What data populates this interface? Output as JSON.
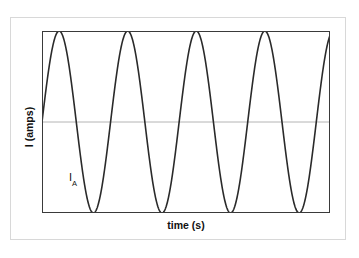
{
  "figure": {
    "name": "alternating-current-waveform",
    "background_color": "#ffffff",
    "outer_border_color": "#d8d8d8",
    "plot_frame_color": "#3a3a3a",
    "midline_color": "#b4b4b4",
    "curve_color": "#2a2a2a"
  },
  "labels": {
    "y_axis": "I (amps)",
    "x_axis": "time (s)",
    "curve_symbol": "I",
    "curve_subscript": "A"
  },
  "chart_data": {
    "type": "line",
    "title": "",
    "xlabel": "time (s)",
    "ylabel": "I (amps)",
    "grid": false,
    "legend": "none",
    "midline_value": 0,
    "xlim": [
      0,
      4.2
    ],
    "ylim": [
      -1,
      1
    ],
    "annotations": [
      {
        "text": "I_A",
        "x": 0.42,
        "y": -0.63
      }
    ],
    "series": [
      {
        "name": "I_A",
        "waveform": "sine",
        "amplitude": 1,
        "cycles": 4.2,
        "period": 1,
        "phase_deg": 0,
        "x": [
          0,
          0.05,
          0.1,
          0.15,
          0.2,
          0.25,
          0.3,
          0.35,
          0.4,
          0.45,
          0.5,
          0.55,
          0.6,
          0.65,
          0.7,
          0.75,
          0.8,
          0.85,
          0.9,
          0.95,
          1.0,
          1.05,
          1.1,
          1.15,
          1.2,
          1.25,
          1.3,
          1.35,
          1.4,
          1.45,
          1.5,
          1.55,
          1.6,
          1.65,
          1.7,
          1.75,
          1.8,
          1.85,
          1.9,
          1.95,
          2.0,
          2.05,
          2.1,
          2.15,
          2.2,
          2.25,
          2.3,
          2.35,
          2.4,
          2.45,
          2.5,
          2.55,
          2.6,
          2.65,
          2.7,
          2.75,
          2.8,
          2.85,
          2.9,
          2.95,
          3.0,
          3.05,
          3.1,
          3.15,
          3.2,
          3.25,
          3.3,
          3.35,
          3.4,
          3.45,
          3.5,
          3.55,
          3.6,
          3.65,
          3.7,
          3.75,
          3.8,
          3.85,
          3.9,
          3.95,
          4.0,
          4.05,
          4.1,
          4.15,
          4.2
        ],
        "y": [
          0,
          0.309,
          0.588,
          0.809,
          0.951,
          1.0,
          0.951,
          0.809,
          0.588,
          0.309,
          0,
          -0.309,
          -0.588,
          -0.809,
          -0.951,
          -1.0,
          -0.951,
          -0.809,
          -0.588,
          -0.309,
          0,
          0.309,
          0.588,
          0.809,
          0.951,
          1.0,
          0.951,
          0.809,
          0.588,
          0.309,
          0,
          -0.309,
          -0.588,
          -0.809,
          -0.951,
          -1.0,
          -0.951,
          -0.809,
          -0.588,
          -0.309,
          0,
          0.309,
          0.588,
          0.809,
          0.951,
          1.0,
          0.951,
          0.809,
          0.588,
          0.309,
          0,
          -0.309,
          -0.588,
          -0.809,
          -0.951,
          -1.0,
          -0.951,
          -0.809,
          -0.588,
          -0.309,
          0,
          0.309,
          0.588,
          0.809,
          0.951,
          1.0,
          0.951,
          0.809,
          0.588,
          0.309,
          0,
          -0.309,
          -0.588,
          -0.809,
          -0.951,
          -1.0,
          -0.951,
          -0.809,
          -0.588,
          -0.309,
          0,
          0.309,
          0.588,
          0.809,
          0.951
        ]
      }
    ]
  }
}
